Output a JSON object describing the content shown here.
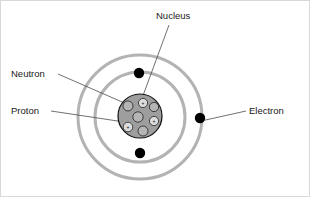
{
  "diagram": {
    "background_color": "#ffffff",
    "border_color": "#d8d8d8",
    "center": {
      "x": 139,
      "y": 116
    }
  },
  "labels": {
    "nucleus": "Nucleus",
    "neutron": "Neutron",
    "proton": "Proton",
    "electron": "Electron"
  },
  "label_positions": [
    {
      "name": "nucleus",
      "text": "Nucleus",
      "x": 155,
      "y": 18,
      "anchor": "start"
    },
    {
      "name": "neutron",
      "text": "Neutron",
      "x": 10,
      "y": 76,
      "anchor": "start"
    },
    {
      "name": "proton",
      "text": "Proton",
      "x": 10,
      "y": 113,
      "anchor": "start"
    },
    {
      "name": "electron",
      "text": "Electron",
      "x": 248,
      "y": 113,
      "anchor": "start"
    }
  ],
  "leader_lines": [
    {
      "name": "nucleus-leader",
      "x1": 168,
      "y1": 24,
      "x2": 140,
      "y2": 100
    },
    {
      "name": "neutron-leader",
      "x1": 57,
      "y1": 73,
      "x2": 128,
      "y2": 104
    },
    {
      "name": "proton-leader",
      "x1": 50,
      "y1": 110,
      "x2": 130,
      "y2": 122
    },
    {
      "name": "electron-leader",
      "x1": 245,
      "y1": 110,
      "x2": 200,
      "y2": 120
    }
  ],
  "orbits": [
    {
      "name": "inner-orbit",
      "radius": 45,
      "stroke": "#b3b3b3",
      "stroke_width": 3
    },
    {
      "name": "outer-orbit",
      "radius": 62,
      "stroke": "#b3b3b3",
      "stroke_width": 3
    }
  ],
  "electrons": [
    {
      "name": "electron-top",
      "x": 138,
      "y": 72,
      "r": 5.2,
      "orbit": "inner-orbit",
      "color": "#000000"
    },
    {
      "name": "electron-bottom",
      "x": 139,
      "y": 152,
      "r": 5.2,
      "orbit": "inner-orbit",
      "color": "#000000"
    },
    {
      "name": "electron-right",
      "x": 199,
      "y": 117,
      "r": 5.2,
      "orbit": "outer-orbit",
      "color": "#000000"
    }
  ],
  "nucleus": {
    "name": "nucleus-body",
    "x": 139,
    "y": 115,
    "radius": 22,
    "fill": "#9e9e9e",
    "stroke": "#111111",
    "proton_count": 3,
    "neutron_count": 4
  },
  "nucleons": [
    {
      "name": "neutron-1",
      "type": "neutron",
      "x": 127,
      "y": 105,
      "r": 5.0,
      "sign": ""
    },
    {
      "name": "proton-1",
      "type": "proton",
      "x": 142,
      "y": 102,
      "r": 4.6,
      "sign": "+"
    },
    {
      "name": "neutron-2",
      "type": "neutron",
      "x": 153,
      "y": 106,
      "r": 4.6,
      "sign": ""
    },
    {
      "name": "neutron-3",
      "type": "neutron",
      "x": 137,
      "y": 116,
      "r": 5.2,
      "sign": ""
    },
    {
      "name": "proton-2",
      "type": "proton",
      "x": 153,
      "y": 120,
      "r": 4.6,
      "sign": "+"
    },
    {
      "name": "proton-3",
      "type": "proton",
      "x": 127,
      "y": 126,
      "r": 4.8,
      "sign": "+"
    },
    {
      "name": "neutron-4",
      "type": "neutron",
      "x": 142,
      "y": 130,
      "r": 5.0,
      "sign": ""
    }
  ]
}
